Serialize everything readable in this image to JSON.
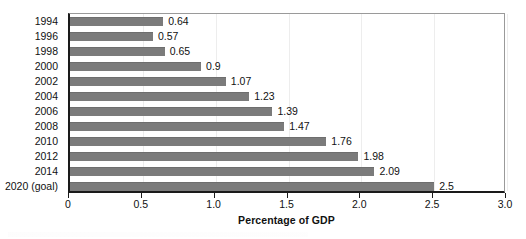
{
  "chart_data": {
    "type": "bar",
    "orientation": "horizontal",
    "title": "",
    "xlabel": "Percentage of GDP",
    "ylabel": "",
    "xlim": [
      0,
      3.0
    ],
    "xticks": [
      "0",
      "0.5",
      "1.0",
      "1.5",
      "2.0",
      "2.5",
      "3.0"
    ],
    "xtick_values": [
      0,
      0.5,
      1.0,
      1.5,
      2.0,
      2.5,
      3.0
    ],
    "grid": true,
    "legend": null,
    "bar_color": "#7b7b7b",
    "categories": [
      "1994",
      "1996",
      "1998",
      "2000",
      "2002",
      "2004",
      "2006",
      "2008",
      "2010",
      "2012",
      "2014",
      "2020 (goal)"
    ],
    "values": [
      0.64,
      0.57,
      0.65,
      0.9,
      1.07,
      1.23,
      1.39,
      1.47,
      1.76,
      1.98,
      2.09,
      2.5
    ],
    "data_labels": [
      "0.64",
      "0.57",
      "0.65",
      "0.9",
      "1.07",
      "1.23",
      "1.39",
      "1.47",
      "1.76",
      "1.98",
      "2.09",
      "2.5"
    ]
  }
}
